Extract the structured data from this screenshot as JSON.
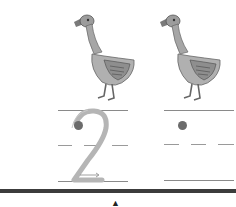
{
  "worksheet": {
    "pictures": [
      {
        "name": "goose",
        "description": "goose illustration 1"
      },
      {
        "name": "goose",
        "description": "goose illustration 2"
      }
    ],
    "count": 2,
    "tracing_digit": "2",
    "practice_box": {
      "has_start_dot": true
    },
    "bottom_marker": "▲",
    "colors": {
      "line": "#8a8a8a",
      "digit": "#b5b5b5",
      "dot": "#6b6b6b",
      "divider": "#3c3c3c",
      "goose_body": "#a9a9a9"
    }
  }
}
